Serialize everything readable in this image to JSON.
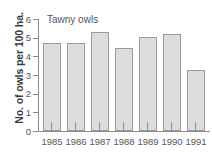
{
  "chart_data": {
    "type": "bar",
    "title": "Tawny owls",
    "xlabel": "",
    "ylabel": "No. of owls per 100 ha.",
    "categories": [
      "1985",
      "1986",
      "1987",
      "1988",
      "1989",
      "1990",
      "1991"
    ],
    "values": [
      4.7,
      4.7,
      5.3,
      4.45,
      5.05,
      5.2,
      3.25
    ],
    "ylim": [
      0,
      6
    ],
    "yticks": [
      0,
      1,
      2,
      3,
      4,
      5,
      6
    ],
    "ytick_labels": [
      "0",
      "1",
      "2",
      "3",
      "4",
      "5",
      "6"
    ],
    "grid": false,
    "legend": null,
    "bar_fill": "#dcdcdc",
    "bar_border": "#9a9a9a",
    "axis_color": "#8c8c8c",
    "background": "#ffffff"
  }
}
